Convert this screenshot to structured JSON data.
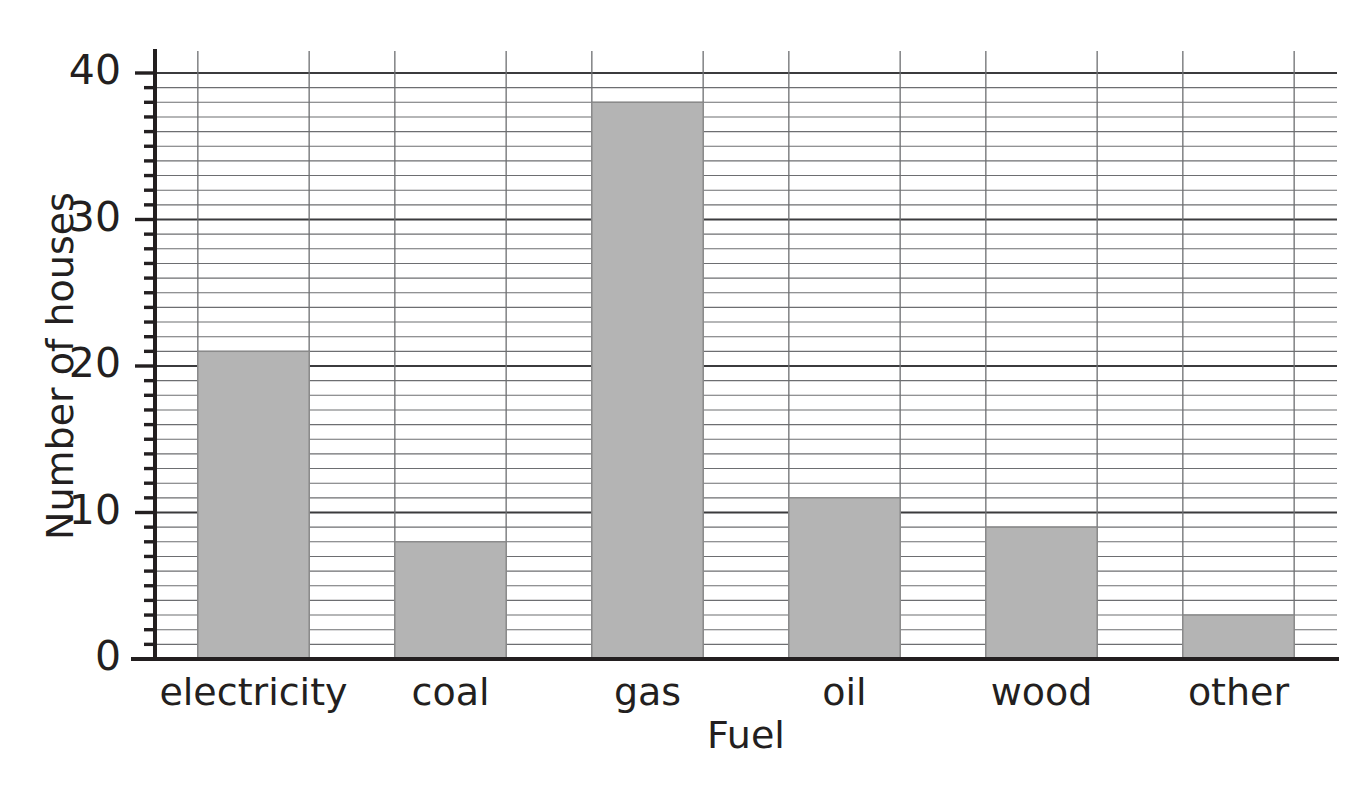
{
  "chart_data": {
    "type": "bar",
    "title": "",
    "categories": [
      "electricity",
      "coal",
      "gas",
      "oil",
      "wood",
      "other"
    ],
    "values": [
      21,
      8,
      38,
      11,
      9,
      3
    ],
    "xlabel": "Fuel",
    "ylabel": "Number of houses",
    "ylim": [
      0,
      40
    ],
    "ytick_labels": [
      "0",
      "10",
      "20",
      "30",
      "40"
    ],
    "ytick_values": [
      0,
      10,
      20,
      30,
      40
    ],
    "minor_tick_step": 1,
    "major_tick_step": 10,
    "grid": "horizontal-minor-and-major plus vertical at bar edges",
    "legend": "none",
    "bar_color": "#b4b4b4",
    "bar_border_color": "#8a8a8a",
    "axis_color": "#231f20",
    "grid_minor_color": "#6d6e71",
    "grid_major_color": "#3b3b3d",
    "background": "#ffffff"
  }
}
